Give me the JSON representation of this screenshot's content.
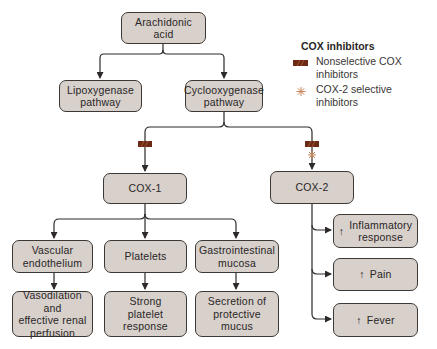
{
  "diagram": {
    "nodes": {
      "arachidonic": "Arachidonic\nacid",
      "lipoxygenase": "Lipoxygenase\npathway",
      "cyclooxygenase": "Cyclooxygenase\npathway",
      "cox1": "COX-1",
      "cox2": "COX-2",
      "vascular": "Vascular\nendothelium",
      "platelets": "Platelets",
      "gi": "Gastrointestinal\nmucosa",
      "vasodilation": "Vasodilation and\neffective renal\nperfusion",
      "strong_platelet": "Strong\nplatelet\nresponse",
      "secretion": "Secretion of\nprotective\nmucus",
      "inflammatory": "Inflammatory\nresponse",
      "pain": "Pain",
      "fever": "Fever"
    },
    "up_arrow_glyph": "↑",
    "legend": {
      "title": "COX inhibitors",
      "items": [
        {
          "icon": "nonselective-bar-icon",
          "label": "Nonselective COX\ninhibitors"
        },
        {
          "icon": "asterisk-icon",
          "label": "COX-2 selective\ninhibitors"
        }
      ]
    },
    "colors": {
      "box_fill": "#d7d0cb",
      "box_border": "#3c3836",
      "nonselective": "#6b2a14",
      "selective": "#c9865a",
      "line": "#2e2a29"
    }
  }
}
